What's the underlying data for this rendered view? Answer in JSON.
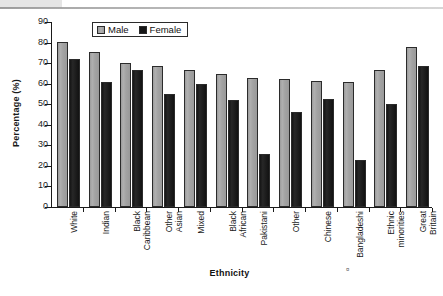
{
  "chart_data": {
    "type": "bar",
    "title": "",
    "xlabel": "Ethnicity",
    "ylabel": "Percentage (%)",
    "ylim": [
      0,
      90
    ],
    "ytick_step": 10,
    "yticks": [
      0,
      10,
      20,
      30,
      40,
      50,
      60,
      70,
      80,
      90
    ],
    "grid": false,
    "legend_position": "top-left-inside",
    "categories": [
      "White",
      "Indian",
      "Black Caribbean",
      "Other Asian",
      "Mixed",
      "Black African",
      "Pakistani",
      "Other",
      "Chinese",
      "Bangladeshi",
      "Ethnic minorities",
      "Great Britain"
    ],
    "category_lines": [
      [
        "White"
      ],
      [
        "Indian"
      ],
      [
        "Black",
        "Caribbean"
      ],
      [
        "Other",
        "Asian"
      ],
      [
        "Mixed"
      ],
      [
        "Black",
        "African"
      ],
      [
        "Pakistani"
      ],
      [
        "Other"
      ],
      [
        "Chinese"
      ],
      [
        "Bangladeshi"
      ],
      [
        "Ethnic",
        "minorities"
      ],
      [
        "Great",
        "Britain"
      ]
    ],
    "series": [
      {
        "name": "Male",
        "color": "#a6a6a6",
        "values": [
          80.5,
          75.5,
          70.0,
          68.5,
          66.5,
          64.5,
          63.0,
          62.5,
          61.5,
          61.0,
          66.5,
          78.0
        ]
      },
      {
        "name": "Female",
        "color": "#161616",
        "values": [
          72.0,
          61.0,
          66.5,
          55.0,
          60.0,
          52.0,
          26.0,
          46.0,
          52.5,
          23.0,
          50.0,
          68.5
        ]
      }
    ]
  },
  "legend": {
    "items": [
      {
        "label": "Male",
        "swatch": "male-swatch-icon"
      },
      {
        "label": "Female",
        "swatch": "female-swatch-icon"
      }
    ]
  },
  "axes": {
    "y_title": "Percentage (%)",
    "x_title": "Ethnicity"
  },
  "artifacts": {
    "corner_mark": "¤"
  }
}
